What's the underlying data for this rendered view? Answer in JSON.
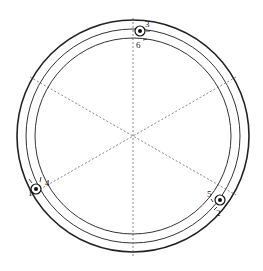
{
  "diagram": {
    "type": "circular cross-section with three probe markers",
    "center": [
      133,
      136
    ],
    "rings": [
      {
        "name": "outer-wall",
        "radius": 116,
        "stroke": "#222222",
        "width": 1.6
      },
      {
        "name": "middle-ring",
        "radius": 106,
        "stroke": "#333333",
        "width": 1
      },
      {
        "name": "inner-ring",
        "radius": 98,
        "stroke": "#333333",
        "width": 1
      }
    ],
    "dashed_axes_deg": [
      90,
      30,
      150
    ],
    "markers": [
      {
        "id": "top",
        "x": 140,
        "y": 31,
        "labels": [
          "3",
          "6"
        ]
      },
      {
        "id": "left",
        "x": 36,
        "y": 189,
        "labels": [
          "1",
          "4"
        ]
      },
      {
        "id": "right",
        "x": 220,
        "y": 200,
        "labels": [
          "5",
          "2"
        ]
      }
    ],
    "labels": {
      "l1": "1",
      "l2": "2",
      "l3": "3",
      "l4": "4",
      "l5": "5",
      "l6": "6"
    }
  }
}
